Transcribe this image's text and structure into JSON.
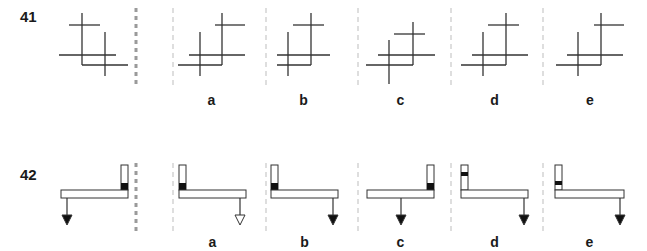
{
  "colors": {
    "line": "#333333",
    "separator_thick": "#9a9a9a",
    "separator_thin": "#c8c8c8",
    "fill_dark": "#111111"
  },
  "questions": [
    {
      "number": "41",
      "number_pos": {
        "x": 20,
        "y": 8
      },
      "thick_separator_x": 136,
      "row_top": 8,
      "row_bottom": 88,
      "figures": [
        {
          "id": "q41-original",
          "label": "",
          "lines": [
            [
              82,
              13,
              82,
              65
            ],
            [
              69,
              25,
              100,
              25
            ],
            [
              105,
              32,
              105,
              76
            ],
            [
              59,
              55,
              116,
              55
            ],
            [
              82,
              65,
              128,
              65
            ]
          ]
        },
        {
          "id": "q41-a",
          "label": "a",
          "lines": [
            [
              200,
              32,
              200,
              76
            ],
            [
              178,
              65,
              222,
              65
            ],
            [
              222,
              13,
              222,
              65
            ],
            [
              189,
              55,
              245,
              55
            ],
            [
              215,
              25,
              245,
              25
            ]
          ]
        },
        {
          "id": "q41-b",
          "label": "b",
          "lines": [
            [
              288,
              32,
              288,
              76
            ],
            [
              277,
              65,
              311,
              65
            ],
            [
              311,
              13,
              311,
              65
            ],
            [
              277,
              55,
              330,
              55
            ],
            [
              293,
              25,
              324,
              25
            ]
          ]
        },
        {
          "id": "q41-c",
          "label": "c",
          "lines": [
            [
              389,
              40,
              389,
              84
            ],
            [
              366,
              65,
              413,
              65
            ],
            [
              413,
              22,
              413,
              65
            ],
            [
              378,
              55,
              435,
              55
            ],
            [
              394,
              34,
              425,
              34
            ]
          ]
        },
        {
          "id": "q41-d",
          "label": "d",
          "lines": [
            [
              483,
              32,
              483,
              76
            ],
            [
              461,
              65,
              506,
              65
            ],
            [
              506,
              13,
              506,
              65
            ],
            [
              472,
              55,
              528,
              55
            ],
            [
              488,
              25,
              519,
              25
            ]
          ]
        },
        {
          "id": "q41-e",
          "label": "e",
          "lines": [
            [
              578,
              32,
              578,
              76
            ],
            [
              556,
              65,
              601,
              65
            ],
            [
              601,
              13,
              601,
              65
            ],
            [
              567,
              55,
              623,
              55
            ],
            [
              594,
              25,
              624,
              25
            ]
          ]
        }
      ],
      "thin_separators_x": [
        173,
        266,
        358,
        451,
        543
      ],
      "labels_y": 92
    },
    {
      "number": "42",
      "number_pos": {
        "x": 20,
        "y": 166
      },
      "thick_separator_x": 136,
      "row_top": 163,
      "row_bottom": 233,
      "figures": [
        {
          "id": "q42-original",
          "label": "",
          "post": {
            "x": 121,
            "y": 165,
            "w": 7,
            "h": 25
          },
          "mark": {
            "x": 121,
            "y": 183,
            "w": 7,
            "h": 7
          },
          "beam": {
            "x": 61,
            "y": 190,
            "w": 67,
            "h": 8
          },
          "arrow": {
            "x": 67,
            "y1": 198,
            "y2": 225,
            "filled": true
          }
        },
        {
          "id": "q42-a",
          "label": "a",
          "post": {
            "x": 179,
            "y": 165,
            "w": 7,
            "h": 25
          },
          "mark": {
            "x": 179,
            "y": 183,
            "w": 7,
            "h": 7
          },
          "beam": {
            "x": 179,
            "y": 190,
            "w": 67,
            "h": 8
          },
          "arrow": {
            "x": 240,
            "y1": 198,
            "y2": 225,
            "filled": false
          }
        },
        {
          "id": "q42-b",
          "label": "b",
          "post": {
            "x": 271,
            "y": 165,
            "w": 7,
            "h": 25
          },
          "mark": {
            "x": 271,
            "y": 183,
            "w": 7,
            "h": 7
          },
          "beam": {
            "x": 271,
            "y": 190,
            "w": 67,
            "h": 8
          },
          "arrow": {
            "x": 333,
            "y1": 198,
            "y2": 225,
            "filled": true
          }
        },
        {
          "id": "q42-c",
          "label": "c",
          "post": {
            "x": 427,
            "y": 165,
            "w": 7,
            "h": 25
          },
          "mark": {
            "x": 427,
            "y": 183,
            "w": 7,
            "h": 7
          },
          "beam": {
            "x": 367,
            "y": 190,
            "w": 67,
            "h": 8
          },
          "arrow": {
            "x": 401,
            "y1": 198,
            "y2": 225,
            "filled": true
          }
        },
        {
          "id": "q42-d",
          "label": "d",
          "post": {
            "x": 461,
            "y": 165,
            "w": 7,
            "h": 25
          },
          "mark": {
            "x": 461,
            "y": 172,
            "w": 7,
            "h": 4
          },
          "beam": {
            "x": 461,
            "y": 190,
            "w": 67,
            "h": 8
          },
          "arrow": {
            "x": 524,
            "y1": 198,
            "y2": 225,
            "filled": true
          }
        },
        {
          "id": "q42-e",
          "label": "e",
          "post": {
            "x": 555,
            "y": 165,
            "w": 7,
            "h": 25
          },
          "mark": {
            "x": 555,
            "y": 181,
            "w": 7,
            "h": 4
          },
          "beam": {
            "x": 555,
            "y": 190,
            "w": 69,
            "h": 8
          },
          "arrow": {
            "x": 620,
            "y1": 198,
            "y2": 225,
            "filled": true
          }
        }
      ],
      "thin_separators_x": [
        173,
        266,
        358,
        451,
        543
      ],
      "labels_y": 234
    }
  ]
}
